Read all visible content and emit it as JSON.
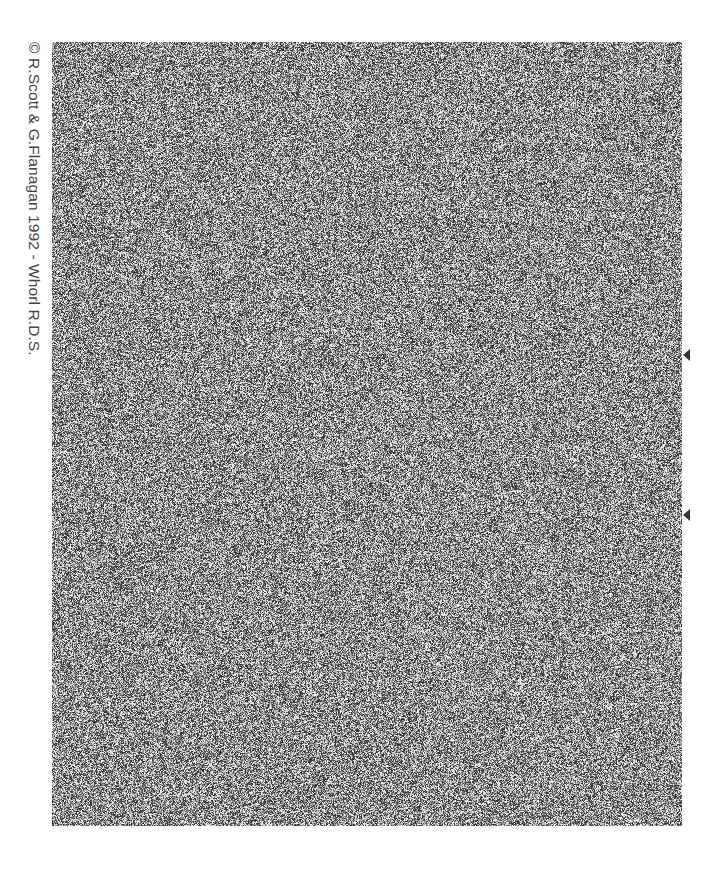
{
  "image": {
    "type": "random-dot stereogram",
    "caption": "© R.Scott & G.Flanagan 1992 - Whorl R.D.S.",
    "field": {
      "left": 52,
      "top": 42,
      "width": 630,
      "height": 784
    },
    "colors": {
      "background": "#ffffff",
      "caption": "#444444",
      "marker": "#333333",
      "noise_dark": "#2a2a2a",
      "noise_light": "#ffffff"
    },
    "markers": [
      {
        "name": "alignment-marker-top",
        "x": 683,
        "y": 349
      },
      {
        "name": "alignment-marker-bottom",
        "x": 683,
        "y": 509
      }
    ]
  }
}
